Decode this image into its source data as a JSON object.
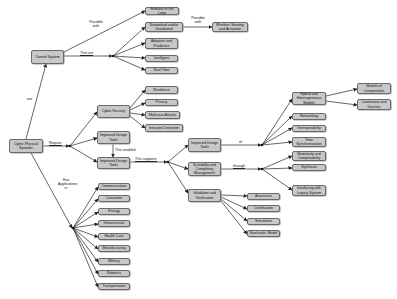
{
  "diagram": {
    "nodes": {
      "cps": "Cyber-Physical Systems",
      "control_system": "Control System",
      "humans_loop": "Humans in the Loop",
      "networked": "Networked and/or Distributed",
      "wireless": "Wireless Sensing and Actuation",
      "adaptive": "Adaptive and Predictive",
      "intelligent": "Intelligent",
      "real_time": "Real Time",
      "cyber_security": "Cyber Security",
      "resilience": "Resilience",
      "privacy": "Privacy",
      "malicious": "Malicious Attacks",
      "intrusion": "Intrusion Detection",
      "idt1": "Improved Design Tools",
      "idt2": "Improved Design Tools",
      "idt3": "Improved Design Tools",
      "scalability": "Scalability and Complexity Management",
      "validation": "Validation and Verification",
      "assurance": "Assurance",
      "certification": "Certification",
      "simulation": "Simulation",
      "stochastic": "Stochastic Model",
      "hybrid": "Hybrid and Heterogeneous Models",
      "models_comp": "Models of Computation",
      "cont_disc": "Continuous and Discrete",
      "networking": "Networking",
      "interop": "Interoperability",
      "time_sync": "Time Synchronization",
      "modularity": "Modularity and Composability",
      "synthesis": "Synthesis",
      "interfacing": "Interfacing with Legacy System",
      "communication": "Communication",
      "consumer": "Consumer",
      "energy": "Energy",
      "infrastructure": "Infrastructure",
      "health_care": "Health Care",
      "manufacturing": "Manufacturing",
      "military": "Military",
      "robotics": "Robotics",
      "transportation": "Transportation"
    },
    "edge_labels": {
      "are": "are",
      "possible_with_1": "Possible with",
      "that_are": "That are",
      "possible_with_2": "Possible with",
      "require": "Require",
      "this_enabled": "This enabled",
      "this_supports": "This supports",
      "of": "of",
      "through": "through",
      "has_applications_in": "Has Applications in"
    },
    "colors": {
      "node_fill": "#c8c8c8",
      "node_border": "#6a6a6a",
      "edge": "#222222"
    }
  }
}
